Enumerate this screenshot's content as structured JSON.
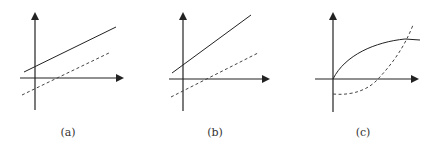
{
  "figure": {
    "panels": [
      {
        "id": "a",
        "label": "(a)",
        "solid": "M24,72 L116,27",
        "dashed": "M22,95 L111,52"
      },
      {
        "id": "b",
        "label": "(b)",
        "solid": "M172,73 L251,15",
        "dashed": "M171,97 L258,53"
      },
      {
        "id": "c",
        "label": "(c)",
        "solid": "M333,79 C345,55 375,42 405,39 L420,40",
        "dashed": "M333,94 C355,96 370,88 378,79 C392,64 404,48 413,25"
      }
    ],
    "color": "#222222"
  }
}
